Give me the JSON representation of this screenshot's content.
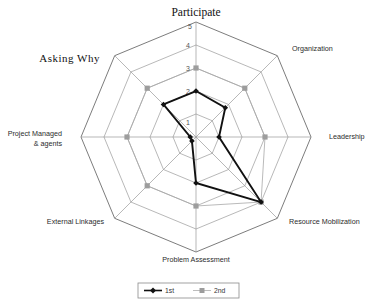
{
  "chart_data": {
    "type": "radar",
    "title": "",
    "categories": [
      "Participate",
      "Organization",
      "Leadership",
      "Resource Mobilization",
      "Problem Assessment",
      "External Linkages",
      "Project Managed\n& agents",
      "Asking  Why"
    ],
    "category_labels": [
      {
        "text": "Participate",
        "style": "serif-title"
      },
      {
        "text": "Organization",
        "style": "plain"
      },
      {
        "text": "Leadership",
        "style": "plain"
      },
      {
        "text": "Resource Mobilization",
        "style": "plain"
      },
      {
        "text": "Problem Assessment",
        "style": "plain"
      },
      {
        "text": "External Linkages",
        "style": "plain"
      },
      {
        "text": "Project Managed",
        "text2": "& agents",
        "style": "plain"
      },
      {
        "text": "Asking  Why",
        "style": "serif-title"
      }
    ],
    "tick_labels": [
      "1",
      "2",
      "3",
      "4",
      "5"
    ],
    "rlim": [
      0,
      5
    ],
    "grid": true,
    "legend_position": "bottom",
    "series": [
      {
        "name": "1st",
        "color": "#111111",
        "marker": "diamond",
        "values": [
          2,
          1.8,
          1.0,
          4.0,
          2.0,
          0.25,
          0.25,
          2.0
        ]
      },
      {
        "name": "2nd",
        "color": "#9d9d9d",
        "marker": "square",
        "values": [
          3,
          3,
          3,
          4.0,
          3,
          3,
          3,
          3
        ]
      }
    ]
  },
  "legend": {
    "entries": [
      {
        "label": "1st"
      },
      {
        "label": "2nd"
      }
    ]
  },
  "ticks": {
    "t1": "1",
    "t2": "2",
    "t3": "3",
    "t4": "4",
    "t5": "5"
  },
  "labels": {
    "participate": "Participate",
    "organization": "Organization",
    "leadership": "Leadership",
    "resource_mobilization": "Resource Mobilization",
    "problem_assessment": "Problem Assessment",
    "external_linkages": "External Linkages",
    "project_managed_l1": "Project Managed",
    "project_managed_l2": "& agents",
    "asking_why": "Asking  Why"
  }
}
